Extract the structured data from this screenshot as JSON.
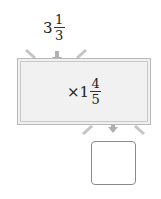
{
  "input": {
    "whole": "3",
    "numerator": "1",
    "denominator": "3"
  },
  "operation": {
    "operator": "×",
    "whole": "1",
    "numerator": "4",
    "denominator": "5"
  },
  "output": {
    "value": ""
  },
  "colors": {
    "machine_fill": "#f1f1f1",
    "machine_border": "#b9b9b9",
    "arrow": "#b0b0b0",
    "funnel": "#c4c4c4",
    "result_border": "#8a8a8a"
  }
}
